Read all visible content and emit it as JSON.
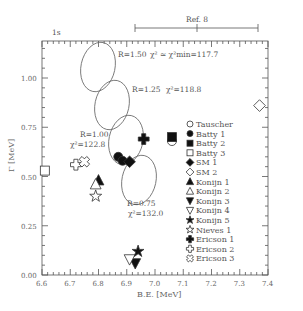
{
  "chart_data": {
    "type": "scatter",
    "title": "",
    "xlabel": "B.E. [MeV]",
    "ylabel": "Γ [MeV]",
    "xlim": [
      6.6,
      7.4
    ],
    "ylim": [
      0.0,
      1.2
    ],
    "xticks": [
      "6.6",
      "6.7",
      "6.8",
      "6.9",
      "7.0",
      "7.1",
      "7.2",
      "7.3",
      "7.4"
    ],
    "yticks": [
      "0.00",
      "0.25",
      "0.50",
      "0.75",
      "1.00"
    ],
    "top_annotations": {
      "left_label": "1s",
      "ref_label": "Ref. 8",
      "ref_range_be": [
        6.93,
        7.37
      ],
      "ref_center_be": 7.15
    },
    "ellipses": [
      {
        "label": "R=1.50",
        "chi2_text": "χ² ≃ χ²min=117.7",
        "center": [
          6.795,
          1.06
        ]
      },
      {
        "label": "R=1.25",
        "chi2_text": "χ²=118.8",
        "center": [
          6.845,
          0.86
        ]
      },
      {
        "label": "R=1.00",
        "chi2_text": "χ²=122.8",
        "center": [
          6.895,
          0.68
        ]
      },
      {
        "label": "R=0.75",
        "chi2_text": "χ²=132.0",
        "center": [
          6.94,
          0.48
        ]
      }
    ],
    "series": [
      {
        "name": "Tauscher",
        "marker": "circle-open",
        "x": [
          7.06
        ],
        "y": [
          0.68
        ]
      },
      {
        "name": "Batty 1",
        "marker": "circle-filled",
        "x": [
          6.87,
          6.885
        ],
        "y": [
          0.6,
          0.58
        ]
      },
      {
        "name": "Batty 2",
        "marker": "square-filled",
        "x": [
          7.06
        ],
        "y": [
          0.7
        ]
      },
      {
        "name": "Batty 3",
        "marker": "square-open",
        "x": [
          6.61
        ],
        "y": [
          0.53
        ]
      },
      {
        "name": "SM 1",
        "marker": "diamond-filled",
        "x": [
          6.91
        ],
        "y": [
          0.575
        ]
      },
      {
        "name": "SM 2",
        "marker": "diamond-open",
        "x": [
          7.37
        ],
        "y": [
          0.86
        ]
      },
      {
        "name": "Konijn 1",
        "marker": "triangle-up-filled",
        "x": [
          6.8
        ],
        "y": [
          0.48
        ]
      },
      {
        "name": "Konijn 2",
        "marker": "triangle-up-open",
        "x": [
          6.79
        ],
        "y": [
          0.46
        ]
      },
      {
        "name": "Konijn 3",
        "marker": "triangle-down-filled",
        "x": [
          6.93
        ],
        "y": [
          0.06
        ]
      },
      {
        "name": "Konijn 4",
        "marker": "triangle-down-open",
        "x": [
          6.91
        ],
        "y": [
          0.08
        ]
      },
      {
        "name": "Konijn 5",
        "marker": "star-filled",
        "x": [
          6.94
        ],
        "y": [
          0.12
        ]
      },
      {
        "name": "Nieves 1",
        "marker": "star-open",
        "x": [
          6.79
        ],
        "y": [
          0.4
        ]
      },
      {
        "name": "Ericson 1",
        "marker": "cross-filled",
        "x": [
          6.96
        ],
        "y": [
          0.69
        ]
      },
      {
        "name": "Ericson 2",
        "marker": "cross-open",
        "x": [
          6.72
        ],
        "y": [
          0.56
        ]
      },
      {
        "name": "Ericson 3",
        "marker": "cross-x-open",
        "x": [
          6.75
        ],
        "y": [
          0.575
        ]
      }
    ],
    "legend_position": "right-middle",
    "grid": false
  },
  "legend": [
    "Tauscher",
    "Batty 1",
    "Batty 2",
    "Batty 3",
    "SM 1",
    "SM 2",
    "Konijn 1",
    "Konijn 2",
    "Konijn 3",
    "Konijn 4",
    "Konijn 5",
    "Nieves 1",
    "Ericson 1",
    "Ericson 2",
    "Ericson 3"
  ]
}
